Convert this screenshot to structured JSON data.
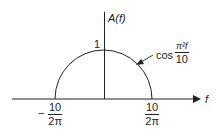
{
  "diagram": {
    "y_axis_label": "A(f)",
    "x_axis_label": "f",
    "peak_label": "1",
    "curve_label": {
      "prefix": "cos",
      "numerator": "π²f",
      "denominator": "10"
    },
    "left_tick": {
      "sign": "−",
      "numerator": "10",
      "denominator": "2π"
    },
    "right_tick": {
      "numerator": "10",
      "denominator": "2π"
    },
    "colors": {
      "line": "#222222",
      "background": "#ffffff"
    }
  }
}
